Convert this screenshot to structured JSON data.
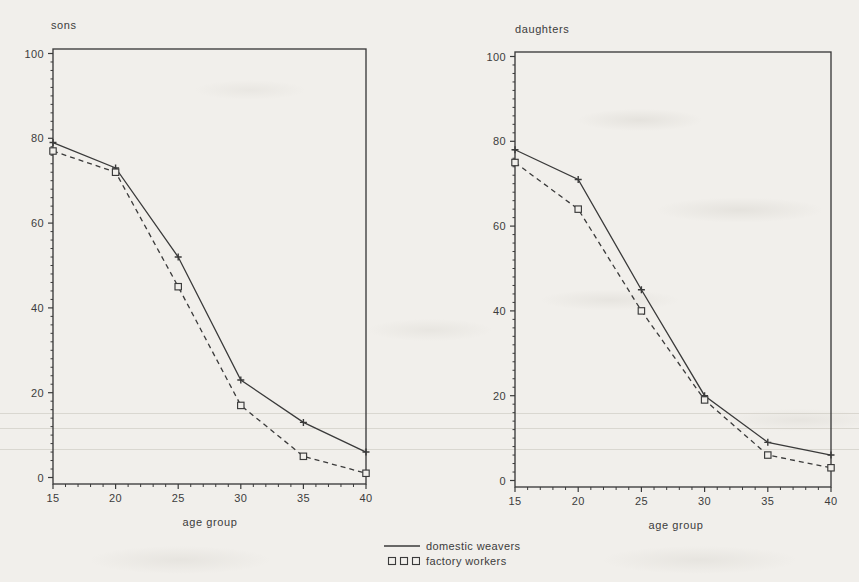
{
  "page": {
    "background": "#f1efeb",
    "ink": "#3a3a3a"
  },
  "legend": {
    "position": "bottom-center",
    "items": [
      {
        "label": "domestic weavers",
        "swatch": "solid-line"
      },
      {
        "label": "factory workers",
        "swatch": "open-squares"
      }
    ]
  },
  "chart_data": [
    {
      "type": "line",
      "title": "sons",
      "xlabel": "age group",
      "ylabel": "",
      "x": [
        15,
        20,
        25,
        30,
        35,
        40
      ],
      "xlim": [
        15,
        40
      ],
      "ylim": [
        0,
        100
      ],
      "xticks": [
        15,
        20,
        25,
        30,
        35,
        40
      ],
      "yticks": [
        0,
        20,
        40,
        60,
        80,
        100
      ],
      "minor_x_step": 1,
      "minor_y_step": 2,
      "grid": false,
      "series": [
        {
          "name": "domestic weavers",
          "line": "solid",
          "marker": "plus",
          "values": [
            79,
            73,
            52,
            23,
            13,
            6
          ]
        },
        {
          "name": "factory workers",
          "line": "dashed",
          "marker": "open-square",
          "values": [
            77,
            72,
            45,
            17,
            5,
            1
          ]
        }
      ]
    },
    {
      "type": "line",
      "title": "daughters",
      "xlabel": "age group",
      "ylabel": "",
      "x": [
        15,
        20,
        25,
        30,
        35,
        40
      ],
      "xlim": [
        15,
        40
      ],
      "ylim": [
        0,
        100
      ],
      "xticks": [
        15,
        20,
        25,
        30,
        35,
        40
      ],
      "yticks": [
        0,
        20,
        40,
        60,
        80,
        100
      ],
      "minor_x_step": 1,
      "minor_y_step": 2,
      "grid": false,
      "series": [
        {
          "name": "domestic weavers",
          "line": "solid",
          "marker": "plus",
          "values": [
            78,
            71,
            45,
            20,
            9,
            6
          ]
        },
        {
          "name": "factory workers",
          "line": "dashed",
          "marker": "open-square",
          "values": [
            75,
            64,
            40,
            19,
            6,
            3
          ]
        }
      ]
    }
  ]
}
